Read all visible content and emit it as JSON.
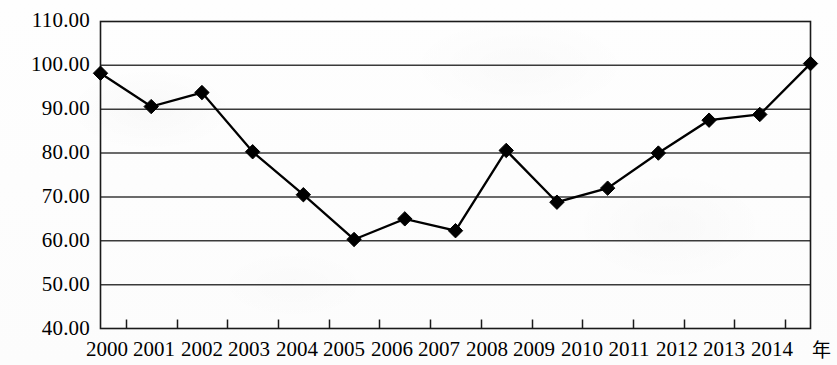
{
  "chart_data": {
    "type": "line",
    "title": "",
    "subtitle": "",
    "xlabel": "年",
    "ylabel": "",
    "categories": [
      "2000",
      "2001",
      "2002",
      "2003",
      "2004",
      "2005",
      "2006",
      "2007",
      "2008",
      "2009",
      "2010",
      "2011",
      "2012",
      "2013",
      "2014"
    ],
    "values": [
      98.2,
      90.6,
      93.8,
      80.3,
      70.5,
      60.3,
      65.0,
      62.3,
      80.6,
      68.8,
      72.0,
      80.0,
      87.5,
      88.8,
      100.4
    ],
    "series": [
      {
        "name": "",
        "values": [
          98.2,
          90.6,
          93.8,
          80.3,
          70.5,
          60.3,
          65.0,
          62.3,
          80.6,
          68.8,
          72.0,
          80.0,
          87.5,
          88.8,
          100.4
        ]
      }
    ],
    "ylim": [
      40,
      110
    ],
    "yticks": [
      40,
      50,
      60,
      70,
      80,
      90,
      100,
      110
    ],
    "ytick_labels": [
      "40.00",
      "50.00",
      "60.00",
      "70.00",
      "80.00",
      "90.00",
      "100.00",
      "110.00"
    ],
    "grid": true,
    "grid_axis": "y",
    "legend": "none",
    "marker": "diamond",
    "line_color": "#000000",
    "marker_color": "#000000",
    "grid_color": "#3a3a3a",
    "axis_color": "#1a1a1a",
    "background_color": "#fdfdfd"
  }
}
